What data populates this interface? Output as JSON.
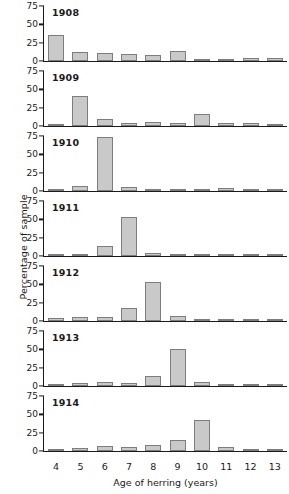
{
  "chart_data": {
    "type": "bar",
    "title": "",
    "xlabel": "Age of herring (years)",
    "ylabel": "Percentage of sample",
    "categories": [
      "4",
      "5",
      "6",
      "7",
      "8",
      "9",
      "10",
      "11",
      "12",
      "13"
    ],
    "ylim": [
      0,
      75
    ],
    "yticks": [
      0,
      25,
      50,
      75
    ],
    "grid": false,
    "legend": "none",
    "panel_layout": "stacked-vertical",
    "bar_color": "#c9c9c9",
    "bar_edge_color": "#7d7d7d",
    "axis_color": "#1a1a1a",
    "panels": [
      {
        "label": "1908",
        "values": [
          35,
          12,
          11,
          10,
          8,
          14,
          3,
          1.5,
          3.5,
          3.5
        ]
      },
      {
        "label": "1909",
        "values": [
          0.5,
          41,
          10,
          4,
          5.5,
          4,
          17,
          3.5,
          4,
          2.5
        ]
      },
      {
        "label": "1910",
        "values": [
          2,
          7,
          74,
          6,
          2,
          1.5,
          2,
          3.5,
          0.5,
          0.5
        ]
      },
      {
        "label": "1911",
        "values": [
          0.7,
          3,
          13,
          53,
          4.5,
          3,
          2,
          0.8,
          0.5,
          0.5
        ]
      },
      {
        "label": "1912",
        "values": [
          3.5,
          5,
          6,
          18,
          53,
          7,
          1.5,
          1.5,
          1.5,
          1
        ]
      },
      {
        "label": "1913",
        "values": [
          0.7,
          3.5,
          5,
          3.5,
          13,
          51,
          6,
          2,
          2,
          1
        ]
      },
      {
        "label": "1914",
        "values": [
          1.5,
          4,
          7,
          6,
          8,
          15,
          42,
          6,
          1.5,
          1.5
        ]
      }
    ]
  }
}
